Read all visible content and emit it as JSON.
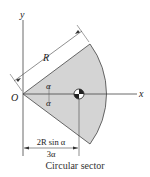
{
  "diagram": {
    "caption": "Circular sector",
    "labels": {
      "y_axis": "y",
      "x_axis": "x",
      "origin": "O",
      "radius": "R",
      "angle_top": "α",
      "angle_bottom": "α",
      "dimension_numerator": "2R sin α",
      "dimension_denominator": "3α"
    },
    "colors": {
      "sector_fill": "#d4d4d4",
      "lines": "#333333"
    }
  }
}
